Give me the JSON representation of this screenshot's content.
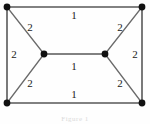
{
  "figure": {
    "type": "weighted-graph",
    "caption": "Figure 1",
    "width": 150,
    "height": 124,
    "background_color": "#fefefe",
    "edge_color": "#585858",
    "vertex_color": "#111111",
    "label_color": "#1a1a1a"
  },
  "vertices": [
    {
      "id": "top-left",
      "label": "",
      "x": 7,
      "y": 7
    },
    {
      "id": "top-right",
      "label": "",
      "x": 142,
      "y": 7
    },
    {
      "id": "mid-left",
      "label": "",
      "x": 44,
      "y": 54
    },
    {
      "id": "mid-right",
      "label": "",
      "x": 105,
      "y": 54
    },
    {
      "id": "bottom-left",
      "label": "",
      "x": 7,
      "y": 103
    },
    {
      "id": "bottom-right",
      "label": "",
      "x": 142,
      "y": 103
    }
  ],
  "edges": [
    {
      "id": "top",
      "from": "top-left",
      "to": "top-right",
      "weight": "1",
      "label_x": 74,
      "label_y": 15
    },
    {
      "id": "left",
      "from": "top-left",
      "to": "bottom-left",
      "weight": "2",
      "label_x": 14,
      "label_y": 54
    },
    {
      "id": "right",
      "from": "top-right",
      "to": "bottom-right",
      "weight": "2",
      "label_x": 135,
      "label_y": 54
    },
    {
      "id": "bottom",
      "from": "bottom-left",
      "to": "bottom-right",
      "weight": "1",
      "label_x": 74,
      "label_y": 94
    },
    {
      "id": "top-left-diagonal",
      "from": "top-left",
      "to": "mid-left",
      "weight": "2",
      "label_x": 30,
      "label_y": 27
    },
    {
      "id": "bottom-left-diagonal",
      "from": "bottom-left",
      "to": "mid-left",
      "weight": "2",
      "label_x": 30,
      "label_y": 83
    },
    {
      "id": "top-right-diagonal",
      "from": "top-right",
      "to": "mid-right",
      "weight": "2",
      "label_x": 120,
      "label_y": 27
    },
    {
      "id": "bottom-right-diagonal",
      "from": "bottom-right",
      "to": "mid-right",
      "weight": "2",
      "label_x": 120,
      "label_y": 83
    },
    {
      "id": "middle",
      "from": "mid-left",
      "to": "mid-right",
      "weight": "1",
      "label_x": 74,
      "label_y": 66
    }
  ]
}
